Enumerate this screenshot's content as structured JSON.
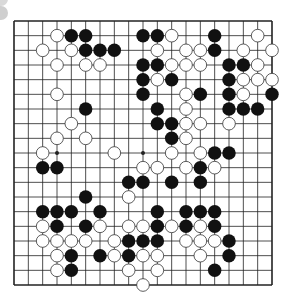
{
  "board": {
    "size": 19,
    "colors": {
      "line": "#222222",
      "black": "#111111",
      "white": "#ffffff",
      "background": "#ffffff",
      "white_stroke": "#333333"
    },
    "star_points": [
      [
        3,
        3
      ],
      [
        9,
        3
      ],
      [
        15,
        3
      ],
      [
        3,
        9
      ],
      [
        9,
        9
      ],
      [
        15,
        9
      ],
      [
        3,
        15
      ],
      [
        9,
        15
      ],
      [
        15,
        15
      ]
    ],
    "black": [
      [
        4,
        1
      ],
      [
        5,
        1
      ],
      [
        9,
        1
      ],
      [
        10,
        1
      ],
      [
        14,
        1
      ],
      [
        5,
        2
      ],
      [
        6,
        2
      ],
      [
        7,
        2
      ],
      [
        14,
        2
      ],
      [
        9,
        3
      ],
      [
        10,
        3
      ],
      [
        15,
        3
      ],
      [
        16,
        3
      ],
      [
        9,
        4
      ],
      [
        11,
        4
      ],
      [
        15,
        4
      ],
      [
        9,
        5
      ],
      [
        13,
        5
      ],
      [
        15,
        5
      ],
      [
        18,
        5
      ],
      [
        5,
        6
      ],
      [
        10,
        6
      ],
      [
        15,
        6
      ],
      [
        16,
        6
      ],
      [
        17,
        6
      ],
      [
        10,
        7
      ],
      [
        11,
        7
      ],
      [
        11,
        8
      ],
      [
        14,
        9
      ],
      [
        15,
        9
      ],
      [
        2,
        10
      ],
      [
        3,
        10
      ],
      [
        13,
        10
      ],
      [
        8,
        11
      ],
      [
        9,
        11
      ],
      [
        11,
        11
      ],
      [
        13,
        11
      ],
      [
        5,
        12
      ],
      [
        2,
        13
      ],
      [
        3,
        13
      ],
      [
        4,
        13
      ],
      [
        6,
        13
      ],
      [
        10,
        13
      ],
      [
        12,
        13
      ],
      [
        13,
        13
      ],
      [
        14,
        13
      ],
      [
        3,
        14
      ],
      [
        5,
        14
      ],
      [
        10,
        14
      ],
      [
        12,
        14
      ],
      [
        14,
        14
      ],
      [
        8,
        15
      ],
      [
        9,
        15
      ],
      [
        10,
        15
      ],
      [
        15,
        15
      ],
      [
        4,
        16
      ],
      [
        6,
        16
      ],
      [
        8,
        16
      ],
      [
        15,
        16
      ],
      [
        4,
        17
      ],
      [
        14,
        17
      ]
    ],
    "white": [
      [
        3,
        1
      ],
      [
        11,
        1
      ],
      [
        17,
        1
      ],
      [
        2,
        2
      ],
      [
        4,
        2
      ],
      [
        10,
        2
      ],
      [
        12,
        2
      ],
      [
        13,
        2
      ],
      [
        16,
        2
      ],
      [
        18,
        2
      ],
      [
        3,
        3
      ],
      [
        5,
        3
      ],
      [
        6,
        3
      ],
      [
        11,
        3
      ],
      [
        12,
        3
      ],
      [
        13,
        3
      ],
      [
        17,
        3
      ],
      [
        10,
        4
      ],
      [
        16,
        4
      ],
      [
        17,
        4
      ],
      [
        18,
        4
      ],
      [
        3,
        5
      ],
      [
        12,
        5
      ],
      [
        16,
        5
      ],
      [
        12,
        6
      ],
      [
        4,
        7
      ],
      [
        12,
        7
      ],
      [
        13,
        7
      ],
      [
        15,
        7
      ],
      [
        3,
        8
      ],
      [
        5,
        8
      ],
      [
        12,
        8
      ],
      [
        2,
        9
      ],
      [
        7,
        9
      ],
      [
        11,
        9
      ],
      [
        13,
        9
      ],
      [
        9,
        10
      ],
      [
        10,
        10
      ],
      [
        12,
        10
      ],
      [
        14,
        10
      ],
      [
        8,
        12
      ],
      [
        2,
        14
      ],
      [
        6,
        14
      ],
      [
        8,
        14
      ],
      [
        9,
        14
      ],
      [
        11,
        14
      ],
      [
        13,
        14
      ],
      [
        2,
        15
      ],
      [
        3,
        15
      ],
      [
        4,
        15
      ],
      [
        5,
        15
      ],
      [
        7,
        15
      ],
      [
        12,
        15
      ],
      [
        13,
        15
      ],
      [
        14,
        15
      ],
      [
        3,
        16
      ],
      [
        7,
        16
      ],
      [
        9,
        16
      ],
      [
        10,
        16
      ],
      [
        13,
        16
      ],
      [
        3,
        17
      ],
      [
        8,
        17
      ],
      [
        10,
        17
      ],
      [
        9,
        18
      ]
    ]
  }
}
